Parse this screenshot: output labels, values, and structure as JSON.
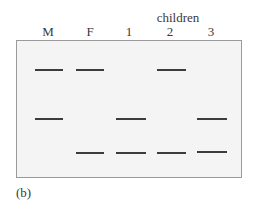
{
  "figure": {
    "group_label": "children",
    "lanes": [
      {
        "id": "M",
        "label": "M"
      },
      {
        "id": "F",
        "label": "F"
      },
      {
        "id": "c1",
        "label": "1"
      },
      {
        "id": "c2",
        "label": "2"
      },
      {
        "id": "c3",
        "label": "3"
      }
    ],
    "bands": {
      "top_row": [
        "M",
        "F",
        "2"
      ],
      "middle_row": [
        "M",
        "1",
        "3"
      ],
      "bottom_row": [
        "F",
        "1",
        "2",
        "3"
      ]
    },
    "caption": "(b)"
  }
}
